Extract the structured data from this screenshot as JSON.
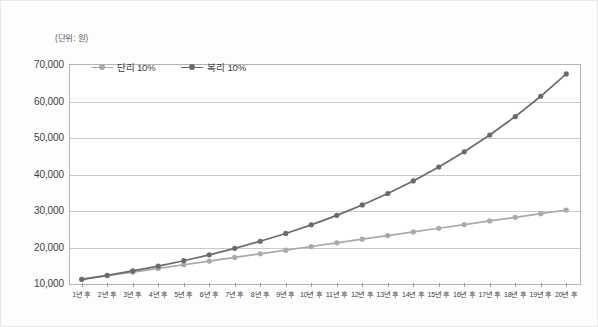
{
  "figure": {
    "unit_caption": "(단위: 원)",
    "border_color": "#b4b4b4",
    "grid_color": "#c9c9c9",
    "background": "#ffffff"
  },
  "legend": {
    "position": "top-left-inside",
    "entries": [
      {
        "label": "단리 10%",
        "color": "#a9a9a9",
        "marker": "circle"
      },
      {
        "label": "복리 10%",
        "color": "#6b6b6b",
        "marker": "circle"
      }
    ]
  },
  "chart_data": {
    "type": "line",
    "title": "",
    "subtitle": "",
    "xlabel": "",
    "ylabel": "",
    "unit_note": "(단위: 원)",
    "grid": true,
    "legend_position": "top-left-inside",
    "categories": [
      "1년 후",
      "2년 후",
      "3년 후",
      "4년 후",
      "5년 후",
      "6년 후",
      "7년 후",
      "8년 후",
      "9년 후",
      "10년 후",
      "11년 후",
      "12년 후",
      "13년 후",
      "14년 후",
      "15년 후",
      "16년 후",
      "17년 후",
      "18년 후",
      "19년 후",
      "20년 후"
    ],
    "ylim": [
      10000,
      70000
    ],
    "yticks": [
      10000,
      20000,
      30000,
      40000,
      50000,
      60000,
      70000
    ],
    "ytick_labels": [
      "10,000",
      "20,000",
      "30,000",
      "40,000",
      "50,000",
      "60,000",
      "70,000"
    ],
    "series": [
      {
        "name": "단리 10%",
        "color": "#a9a9a9",
        "marker": "circle",
        "values": [
          11000,
          12000,
          13000,
          14000,
          15000,
          16000,
          17000,
          18000,
          19000,
          20000,
          21000,
          22000,
          23000,
          24000,
          25000,
          26000,
          27000,
          28000,
          29000,
          30000
        ]
      },
      {
        "name": "복리 10%",
        "color": "#6b6b6b",
        "marker": "circle",
        "values": [
          11000,
          12100,
          13310,
          14641,
          16105,
          17716,
          19487,
          21436,
          23579,
          25937,
          28531,
          31384,
          34523,
          37975,
          41772,
          45950,
          50545,
          55599,
          61159,
          67275
        ]
      }
    ]
  }
}
